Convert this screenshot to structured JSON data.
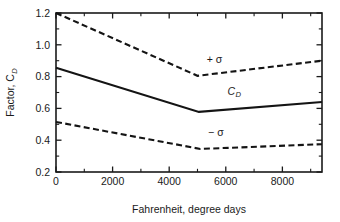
{
  "chart_data": {
    "type": "line",
    "title": "",
    "xlabel": "Fahrenheit, degree days",
    "ylabel": "Factor, C_D",
    "ylabel_main": "Factor, C",
    "ylabel_sub": "D",
    "xlim": [
      0,
      9400
    ],
    "ylim": [
      0.2,
      1.2
    ],
    "grid": false,
    "legend": "inline-annotations",
    "xticks": [
      0,
      2000,
      4000,
      6000,
      8000
    ],
    "xtick_labels": [
      "0",
      "2000",
      "4000",
      "6000",
      "8000"
    ],
    "xminor_step": 1000,
    "yticks": [
      0.2,
      0.4,
      0.6,
      0.8,
      1.0,
      1.2
    ],
    "ytick_labels": [
      "0.2",
      "0.4",
      "0.6",
      "0.8",
      "1.0",
      "1.2"
    ],
    "yminor_step": 0.1,
    "series": [
      {
        "name": "+ σ",
        "style": "dashed",
        "label": "+ σ",
        "label_x": 5600,
        "label_y": 0.885,
        "x": [
          0,
          5000,
          9400
        ],
        "values": [
          1.2,
          0.805,
          0.9
        ]
      },
      {
        "name": "C_D",
        "style": "solid",
        "label": "C",
        "label_sub": "D",
        "label_x": 6300,
        "label_y": 0.685,
        "x": [
          0,
          5050,
          9400
        ],
        "values": [
          0.855,
          0.578,
          0.64
        ]
      },
      {
        "name": "− σ",
        "style": "dashed",
        "label": "− σ",
        "label_x": 5650,
        "label_y": 0.425,
        "x": [
          0,
          5100,
          9400
        ],
        "values": [
          0.515,
          0.345,
          0.375
        ]
      }
    ]
  },
  "colors": {
    "curve": "#141414",
    "axis": "#1a1a1a",
    "background": "#ffffff"
  }
}
